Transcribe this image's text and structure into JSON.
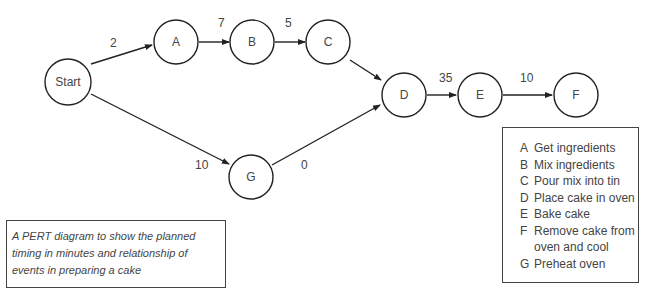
{
  "diagram": {
    "type": "PERT",
    "nodes": [
      {
        "id": "start",
        "label": "Start",
        "x": 68,
        "y": 82
      },
      {
        "id": "A",
        "label": "A",
        "x": 176,
        "y": 42
      },
      {
        "id": "B",
        "label": "B",
        "x": 252,
        "y": 42
      },
      {
        "id": "C",
        "label": "C",
        "x": 328,
        "y": 42
      },
      {
        "id": "D",
        "label": "D",
        "x": 404,
        "y": 95
      },
      {
        "id": "E",
        "label": "E",
        "x": 480,
        "y": 95
      },
      {
        "id": "F",
        "label": "F",
        "x": 576,
        "y": 95
      },
      {
        "id": "G",
        "label": "G",
        "x": 251,
        "y": 177
      }
    ],
    "edges": [
      {
        "from": "start",
        "to": "A",
        "label": "2"
      },
      {
        "from": "A",
        "to": "B",
        "label": "7"
      },
      {
        "from": "B",
        "to": "C",
        "label": "5"
      },
      {
        "from": "C",
        "to": "D",
        "label": ""
      },
      {
        "from": "start",
        "to": "G",
        "label": "10"
      },
      {
        "from": "G",
        "to": "D",
        "label": "0"
      },
      {
        "from": "D",
        "to": "E",
        "label": "35"
      },
      {
        "from": "E",
        "to": "F",
        "label": "10"
      }
    ]
  },
  "legend": {
    "items": [
      {
        "key": "A",
        "text": "Get ingredients"
      },
      {
        "key": "B",
        "text": "Mix ingredients"
      },
      {
        "key": "C",
        "text": "Pour mix into tin"
      },
      {
        "key": "D",
        "text": "Place cake in oven"
      },
      {
        "key": "E",
        "text": "Bake cake"
      },
      {
        "key": "F",
        "text": "Remove cake from\noven and cool"
      },
      {
        "key": "G",
        "text": "Preheat oven"
      }
    ]
  },
  "caption": {
    "text": "A PERT diagram to show the planned timing in minutes and relationship of events in preparing a cake"
  }
}
